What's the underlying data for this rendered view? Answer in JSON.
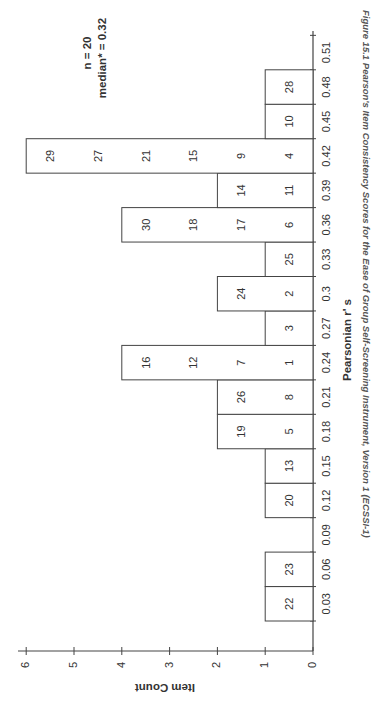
{
  "chart_data": {
    "type": "bar",
    "orientation": "rotated-90-ccw histogram (stem-and-leaf style)",
    "title": "",
    "annotation": {
      "n": "n = 20",
      "median": "median* = 0.32"
    },
    "xlabel": "Pearsonian r' s",
    "ylabel": "Item Count",
    "ylim": [
      0,
      6
    ],
    "yticks": [
      "0",
      "1",
      "2",
      "3",
      "4",
      "5",
      "6"
    ],
    "categories": [
      "0.03",
      "0.06",
      "0.09",
      "0.12",
      "0.15",
      "0.18",
      "0.21",
      "0.24",
      "0.27",
      "0.3",
      "0.33",
      "0.36",
      "0.39",
      "0.42",
      "0.45",
      "0.48",
      "0.51"
    ],
    "values": [
      1,
      1,
      0,
      1,
      1,
      2,
      2,
      4,
      1,
      2,
      1,
      4,
      2,
      5,
      1,
      1,
      0
    ],
    "bars": [
      {
        "bin": "0.03",
        "count": 1,
        "items": [
          "22"
        ]
      },
      {
        "bin": "0.06",
        "count": 1,
        "items": [
          "23"
        ]
      },
      {
        "bin": "0.09",
        "count": 0,
        "items": []
      },
      {
        "bin": "0.12",
        "count": 1,
        "items": [
          "20"
        ]
      },
      {
        "bin": "0.15",
        "count": 1,
        "items": [
          "13"
        ]
      },
      {
        "bin": "0.18",
        "count": 2,
        "items": [
          "5",
          "19"
        ]
      },
      {
        "bin": "0.21",
        "count": 2,
        "items": [
          "8",
          "26"
        ]
      },
      {
        "bin": "0.24",
        "count": 4,
        "items": [
          "1",
          "7",
          "12",
          "16"
        ]
      },
      {
        "bin": "0.27",
        "count": 1,
        "items": [
          "3"
        ]
      },
      {
        "bin": "0.3",
        "count": 2,
        "items": [
          "2",
          "24"
        ]
      },
      {
        "bin": "0.33",
        "count": 1,
        "items": [
          "25"
        ]
      },
      {
        "bin": "0.36",
        "count": 4,
        "items": [
          "6",
          "17",
          "18",
          "30"
        ]
      },
      {
        "bin": "0.39",
        "count": 2,
        "items": [
          "11",
          "14"
        ]
      },
      {
        "bin": "0.42",
        "count": 5,
        "items": [
          "4",
          "9",
          "15",
          "21",
          "27",
          "29"
        ]
      },
      {
        "bin": "0.45",
        "count": 1,
        "items": [
          "10"
        ]
      },
      {
        "bin": "0.48",
        "count": 1,
        "items": [
          "28"
        ]
      }
    ],
    "grid": false,
    "legend": null
  },
  "caption": "Figure 15.1 Pearson's Item Consistency Scores for the Ease of Group Self-Screening Instrument, Version 1 (ECSSI-1)"
}
